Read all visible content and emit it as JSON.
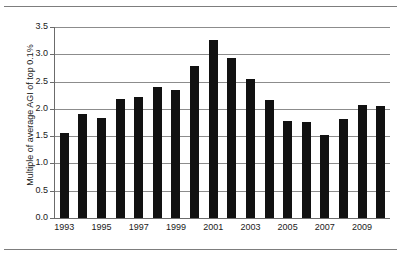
{
  "chart_data": {
    "type": "bar",
    "title": "",
    "subtitle": "",
    "xlabel": "",
    "ylabel": "Multiple of average AGI of top 0.1%",
    "categories": [
      "1993",
      "1994",
      "1995",
      "1996",
      "1997",
      "1998",
      "1999",
      "2000",
      "2001",
      "2002",
      "2003",
      "2004",
      "2005",
      "2006",
      "2007",
      "2008",
      "2009",
      "2010"
    ],
    "values": [
      1.56,
      1.9,
      1.84,
      2.19,
      2.22,
      2.4,
      2.34,
      2.79,
      3.27,
      2.94,
      2.55,
      2.16,
      1.78,
      1.76,
      1.52,
      1.82,
      2.08,
      2.06
    ],
    "series": [
      {
        "name": "Multiple of average AGI of top 0.1%",
        "values": [
          1.56,
          1.9,
          1.84,
          2.19,
          2.22,
          2.4,
          2.34,
          2.79,
          3.27,
          2.94,
          2.55,
          2.16,
          1.78,
          1.76,
          1.52,
          1.82,
          2.08,
          2.06
        ]
      }
    ],
    "ylim": [
      0.0,
      3.5
    ],
    "ytick_values": [
      0.0,
      0.5,
      1.0,
      1.5,
      2.0,
      2.5,
      3.0,
      3.5
    ],
    "ytick_labels": [
      "0.0",
      "0.5",
      "1.0",
      "1.5",
      "2.0",
      "2.5",
      "3.0",
      "3.5"
    ],
    "xtick_labels": [
      "1993",
      "1995",
      "1997",
      "1999",
      "2001",
      "2003",
      "2005",
      "2007",
      "2009"
    ],
    "xtick_categories": [
      "1993",
      "1995",
      "1997",
      "1999",
      "2001",
      "2003",
      "2005",
      "2007",
      "2009"
    ],
    "grid": true,
    "grid_axis": "y",
    "legend": false,
    "legend_position": "none",
    "bar_color": "#111111",
    "grid_color": "#8c8c8c",
    "axis_color": "#6b6b6b",
    "background_color": "#ffffff",
    "annotations": []
  },
  "figure": {
    "top_rule": "",
    "bottom_rule": ""
  }
}
